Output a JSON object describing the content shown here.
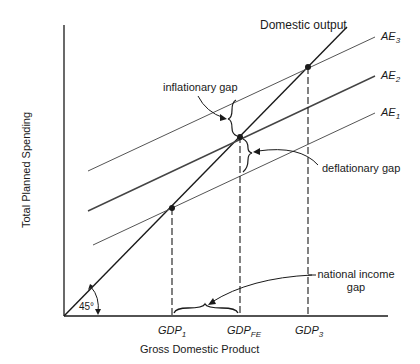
{
  "diagram": {
    "title": "",
    "axes": {
      "x_label": "Gross Domestic Product",
      "y_label": "Total Planned Spending",
      "angle_label": "45°"
    },
    "lines": {
      "domestic_output": "Domestic output",
      "ae3": {
        "base": "AE",
        "sub": "3"
      },
      "ae2": {
        "base": "AE",
        "sub": "2"
      },
      "ae1": {
        "base": "AE",
        "sub": "1"
      }
    },
    "x_ticks": [
      {
        "base": "GDP",
        "sub": "1"
      },
      {
        "base": "GDP",
        "sub": "FE"
      },
      {
        "base": "GDP",
        "sub": "3"
      }
    ],
    "annotations": {
      "inflationary_gap": "inflationary gap",
      "deflationary_gap": "deflationary gap",
      "national_income_gap_line1": "national income",
      "national_income_gap_line2": "gap"
    },
    "colors": {
      "ink": "#1a1a1a",
      "ae_line": "#555555",
      "background": "#ffffff"
    }
  }
}
